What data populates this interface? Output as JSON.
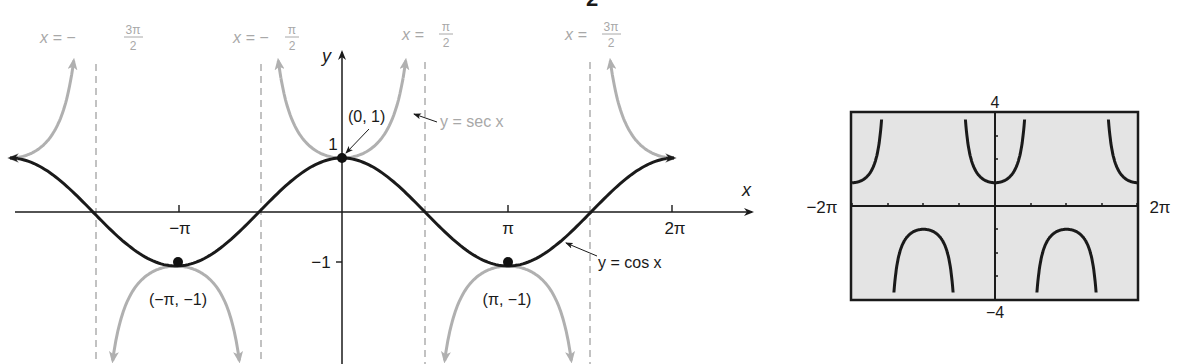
{
  "chart_data": [
    {
      "type": "line",
      "title": "",
      "xlabel": "x",
      "ylabel": "y",
      "xlim": [
        -6.6,
        7.6
      ],
      "ylim": [
        -2.8,
        3.0
      ],
      "x_ticks": [
        {
          "value": -3.14159,
          "label": "−π"
        },
        {
          "value": 3.14159,
          "label": "π"
        },
        {
          "value": 6.28318,
          "label": "2π"
        }
      ],
      "y_ticks": [
        {
          "value": 1,
          "label": "1"
        },
        {
          "value": -1,
          "label": "−1"
        }
      ],
      "series": [
        {
          "name": "y = cos x",
          "color": "#1a1a1a",
          "function": "cos(x)",
          "x_range": [
            -6.28,
            6.28
          ]
        },
        {
          "name": "y = sec x",
          "color": "#a8a8a8",
          "function": "sec(x)",
          "x_range": [
            -6.28,
            6.28
          ]
        }
      ],
      "asymptotes": [
        {
          "x": -4.712,
          "label_prefix": "x = −",
          "label_num": "3π",
          "label_den": "2"
        },
        {
          "x": -1.571,
          "label_prefix": "x = −",
          "label_num": "π",
          "label_den": "2"
        },
        {
          "x": 1.571,
          "label_prefix": "x = ",
          "label_num": "π",
          "label_den": "2"
        },
        {
          "x": 4.712,
          "label_prefix": "x = ",
          "label_num": "3π",
          "label_den": "2"
        }
      ],
      "points": [
        {
          "x": 0,
          "y": 1,
          "label": "(0, 1)"
        },
        {
          "x": -3.14159,
          "y": -1,
          "label": "(−π, −1)"
        },
        {
          "x": 3.14159,
          "y": -1,
          "label": "(π, −1)"
        }
      ],
      "annotations": [
        {
          "text": "y = sec x",
          "points_to": "sec curve near x≈1"
        },
        {
          "text": "y = cos x",
          "points_to": "cos curve near x≈4"
        }
      ],
      "grid": false,
      "legend": "none"
    },
    {
      "type": "line",
      "title": "Graphing calculator view of y = sec x",
      "xlim": [
        -6.28318,
        6.28318
      ],
      "ylim": [
        -4,
        4
      ],
      "x_range_labels": {
        "min": "−2π",
        "max": "2π"
      },
      "y_range_labels": {
        "max": "4",
        "min": "−4"
      },
      "series": [
        {
          "name": "y = sec x",
          "color": "#1a1a1a",
          "function": "sec(x)"
        }
      ],
      "background": "#e4e4e4",
      "grid": false
    }
  ],
  "top_fragment": "2",
  "main_graph": {
    "axis_x_label": "x",
    "axis_y_label": "y",
    "tick_neg_pi": "−π",
    "tick_pi": "π",
    "tick_2pi": "2π",
    "tick_y1": "1",
    "tick_ym1": "−1",
    "asym1_prefix": "x = −",
    "asym1_num": "3π",
    "asym1_den": "2",
    "asym2_prefix": "x = −",
    "asym2_num": "π",
    "asym2_den": "2",
    "asym3_prefix": "x = ",
    "asym3_num": "π",
    "asym3_den": "2",
    "asym4_prefix": "x = ",
    "asym4_num": "3π",
    "asym4_den": "2",
    "point_top": "(0, 1)",
    "point_left": "(−π, −1)",
    "point_right": "(π, −1)",
    "sec_label": "y = sec x",
    "cos_label": "y = cos x"
  },
  "calculator": {
    "ymax": "4",
    "ymin": "−4",
    "xmin": "−2π",
    "xmax": "2π"
  }
}
